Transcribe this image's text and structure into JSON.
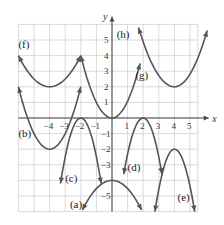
{
  "chart_data": {
    "type": "line",
    "title": "",
    "xlabel": "x",
    "ylabel": "y",
    "xlim": [
      -6.2,
      6.4
    ],
    "ylim": [
      -6.2,
      6.2
    ],
    "grid": true,
    "x_ticks": [
      -4,
      -3,
      -2,
      -1,
      1,
      2,
      3,
      4,
      5
    ],
    "y_ticks": [
      -5,
      -3,
      -2,
      -1,
      1,
      2,
      3,
      4,
      5
    ],
    "x_tick_labels": [
      "−4",
      "−3",
      "−2",
      "−1",
      "1",
      "2",
      "3",
      "4",
      "5"
    ],
    "y_tick_labels": [
      "−5",
      "−3",
      "−2",
      "−1",
      "1",
      "2",
      "3",
      "4",
      "5"
    ],
    "series": [
      {
        "name": "(a)",
        "label_pos": [
          -2.7,
          -5.8
        ],
        "vertex": [
          0,
          -4
        ],
        "x": [
          -1.9,
          -1,
          0,
          1,
          1.9
        ],
        "y": [
          -5.9,
          -4.5,
          -4,
          -4.5,
          -5.9
        ]
      },
      {
        "name": "(b)",
        "label_pos": [
          -6.0,
          -1.2
        ],
        "vertex": [
          -4,
          -2
        ],
        "x": [
          -6,
          -5,
          -4,
          -3,
          -2
        ],
        "y": [
          2,
          -1,
          -2,
          -1,
          2
        ]
      },
      {
        "name": "(c)",
        "label_pos": [
          -3.0,
          -4.1
        ],
        "vertex": [
          -2,
          0
        ],
        "x": [
          -3.3,
          -2.7,
          -2,
          -1.3,
          -0.7
        ],
        "y": [
          -4.2,
          -1.2,
          0,
          -1.2,
          -4.2
        ]
      },
      {
        "name": "(d)",
        "label_pos": [
          1.0,
          -3.4
        ],
        "vertex": [
          2,
          0
        ],
        "x": [
          0.75,
          1.4,
          2,
          2.6,
          3.2
        ],
        "y": [
          -3.6,
          -0.9,
          0,
          -0.9,
          -3.6
        ]
      },
      {
        "name": "(e)",
        "label_pos": [
          4.2,
          -5.3
        ],
        "vertex": [
          4,
          -2
        ],
        "x": [
          2.75,
          3.4,
          4,
          4.6,
          5.3
        ],
        "y": [
          -6,
          -2.7,
          -2,
          -2.7,
          -6
        ]
      },
      {
        "name": "(f)",
        "label_pos": [
          -6.0,
          4.5
        ],
        "vertex": [
          -4,
          2
        ],
        "x": [
          -6,
          -5,
          -4,
          -3,
          -2
        ],
        "y": [
          4,
          2.5,
          2,
          2.5,
          4
        ]
      },
      {
        "name": "(g)",
        "label_pos": [
          1.5,
          2.5
        ],
        "vertex": [
          0,
          0
        ],
        "x": [
          -2,
          -1,
          0,
          1,
          1.8
        ],
        "y": [
          4,
          1,
          0,
          1,
          3.5
        ]
      },
      {
        "name": "(h)",
        "label_pos": [
          0.3,
          5.1
        ],
        "vertex": [
          4,
          2
        ],
        "x": [
          1.7,
          2.8,
          4,
          5.2,
          6.1
        ],
        "y": [
          5.8,
          3.2,
          2,
          3.2,
          5.6
        ]
      }
    ]
  },
  "axes": {
    "x_label": "x",
    "y_label": "y"
  }
}
